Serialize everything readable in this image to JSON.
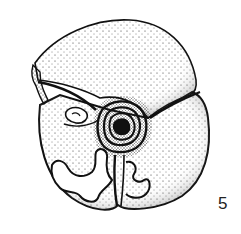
{
  "figure": {
    "label": "5",
    "colors": {
      "ink": "#111111",
      "paper": "#ffffff"
    }
  }
}
